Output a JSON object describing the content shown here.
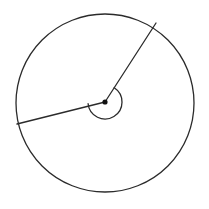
{
  "figure": {
    "title": "Circle with two radii forming a reflex central angle",
    "background_color": "#ffffff",
    "stroke_color": "#2b2b2b",
    "vertex_fill_color": "#111111",
    "canvas": {
      "width": 209,
      "height": 209
    }
  },
  "chart_data": {
    "type": "diagram",
    "title": "Circle with two radii forming a reflex central angle",
    "shapes": [
      {
        "name": "circle-outline",
        "kind": "circle",
        "center_x": 105,
        "center_y": 103,
        "radius": 89,
        "stroke": "#2b2b2b",
        "stroke_width": 1.3,
        "fill": "none"
      },
      {
        "name": "radius-upper-right",
        "kind": "segment",
        "x1": 105,
        "y1": 102,
        "x2": 156,
        "y2": 23,
        "angle_degrees": 57.2,
        "stroke": "#2b2b2b",
        "stroke_width": 1.3
      },
      {
        "name": "radius-left",
        "kind": "segment",
        "x1": 105,
        "y1": 102,
        "x2": 17,
        "y2": 124,
        "angle_degrees": 185.9,
        "stroke": "#2b2b2b",
        "stroke_width": 1.3
      },
      {
        "name": "reflex-angle-arc",
        "kind": "arc",
        "center_x": 105,
        "center_y": 102,
        "radius": 17,
        "start_angle_degrees": 57.2,
        "end_angle_degrees": 185.9,
        "sweep": "clockwise-reflex",
        "measure_degrees": 231.3,
        "stroke": "#2b2b2b",
        "stroke_width": 1.3,
        "fill": "none"
      },
      {
        "name": "center-vertex-dot",
        "kind": "dot",
        "cx": 105,
        "cy": 102,
        "radius": 2.6,
        "fill": "#111111"
      }
    ],
    "labels": [],
    "legend": null,
    "grid": false
  }
}
